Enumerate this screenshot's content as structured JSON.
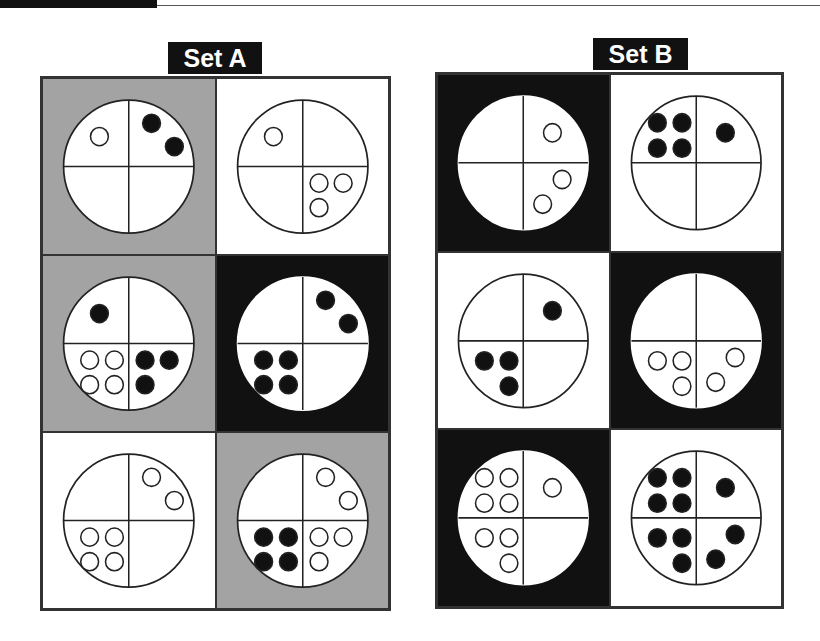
{
  "colors": {
    "white": "#ffffff",
    "gray": "#a3a3a3",
    "black": "#111111",
    "line": "#222222"
  },
  "sets": [
    {
      "label": "Set A",
      "label_box": {
        "left": 168,
        "top": 42,
        "width": 94
      },
      "grid_box": {
        "left": 40,
        "top": 76,
        "width": 351,
        "height": 535
      },
      "cells": [
        {
          "bg": "gray",
          "quadrants": {
            "tl": {
              "filled": 0,
              "hollow": 1
            },
            "tr": {
              "filled": 2,
              "hollow": 0
            },
            "bl": {
              "filled": 0,
              "hollow": 0
            },
            "br": {
              "filled": 0,
              "hollow": 0
            }
          }
        },
        {
          "bg": "white",
          "quadrants": {
            "tl": {
              "filled": 0,
              "hollow": 1
            },
            "tr": {
              "filled": 0,
              "hollow": 0
            },
            "bl": {
              "filled": 0,
              "hollow": 0
            },
            "br": {
              "filled": 0,
              "hollow": 3
            }
          }
        },
        {
          "bg": "gray",
          "quadrants": {
            "tl": {
              "filled": 1,
              "hollow": 0
            },
            "tr": {
              "filled": 0,
              "hollow": 0
            },
            "bl": {
              "filled": 0,
              "hollow": 4
            },
            "br": {
              "filled": 3,
              "hollow": 0
            }
          }
        },
        {
          "bg": "black",
          "quadrants": {
            "tl": {
              "filled": 0,
              "hollow": 0
            },
            "tr": {
              "filled": 2,
              "hollow": 0
            },
            "bl": {
              "filled": 4,
              "hollow": 0
            },
            "br": {
              "filled": 0,
              "hollow": 0
            }
          }
        },
        {
          "bg": "white",
          "quadrants": {
            "tl": {
              "filled": 0,
              "hollow": 0
            },
            "tr": {
              "filled": 0,
              "hollow": 2
            },
            "bl": {
              "filled": 0,
              "hollow": 4
            },
            "br": {
              "filled": 0,
              "hollow": 0
            }
          }
        },
        {
          "bg": "gray",
          "quadrants": {
            "tl": {
              "filled": 0,
              "hollow": 0
            },
            "tr": {
              "filled": 0,
              "hollow": 2
            },
            "bl": {
              "filled": 4,
              "hollow": 0
            },
            "br": {
              "filled": 0,
              "hollow": 3
            }
          }
        }
      ]
    },
    {
      "label": "Set B",
      "label_box": {
        "left": 593,
        "top": 38,
        "width": 95
      },
      "grid_box": {
        "left": 435,
        "top": 72,
        "width": 349,
        "height": 537
      },
      "cells": [
        {
          "bg": "black",
          "quadrants": {
            "tl": {
              "filled": 0,
              "hollow": 0
            },
            "tr": {
              "filled": 0,
              "hollow": 1
            },
            "bl": {
              "filled": 0,
              "hollow": 0
            },
            "br": {
              "filled": 0,
              "hollow": 2
            }
          }
        },
        {
          "bg": "white",
          "quadrants": {
            "tl": {
              "filled": 4,
              "hollow": 0
            },
            "tr": {
              "filled": 1,
              "hollow": 0
            },
            "bl": {
              "filled": 0,
              "hollow": 0
            },
            "br": {
              "filled": 0,
              "hollow": 0
            }
          }
        },
        {
          "bg": "white",
          "quadrants": {
            "tl": {
              "filled": 0,
              "hollow": 0
            },
            "tr": {
              "filled": 1,
              "hollow": 0
            },
            "bl": {
              "filled": 3,
              "hollow": 0
            },
            "br": {
              "filled": 0,
              "hollow": 0
            }
          }
        },
        {
          "bg": "black",
          "quadrants": {
            "tl": {
              "filled": 0,
              "hollow": 0
            },
            "tr": {
              "filled": 0,
              "hollow": 0
            },
            "bl": {
              "filled": 0,
              "hollow": 3
            },
            "br": {
              "filled": 0,
              "hollow": 2
            }
          }
        },
        {
          "bg": "black",
          "quadrants": {
            "tl": {
              "filled": 0,
              "hollow": 4
            },
            "tr": {
              "filled": 0,
              "hollow": 1
            },
            "bl": {
              "filled": 0,
              "hollow": 3
            },
            "br": {
              "filled": 0,
              "hollow": 0
            }
          }
        },
        {
          "bg": "white",
          "quadrants": {
            "tl": {
              "filled": 4,
              "hollow": 0
            },
            "tr": {
              "filled": 1,
              "hollow": 0
            },
            "bl": {
              "filled": 3,
              "hollow": 0
            },
            "br": {
              "filled": 2,
              "hollow": 0
            }
          }
        }
      ]
    }
  ]
}
